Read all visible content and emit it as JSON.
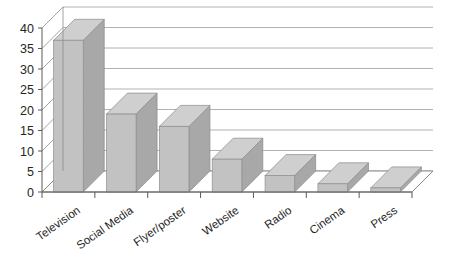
{
  "chart_data": {
    "type": "bar",
    "title": "",
    "subtitle": "",
    "xlabel": "",
    "ylabel": "",
    "categories": [
      "Television",
      "Social Media",
      "Flyer/poster",
      "Website",
      "Radio",
      "Cinema",
      "Press"
    ],
    "values": [
      37,
      19,
      16,
      8,
      4,
      2,
      1
    ],
    "series": [
      {
        "name": "",
        "values": [
          37,
          19,
          16,
          8,
          4,
          2,
          1
        ]
      }
    ],
    "ylim": [
      0,
      40
    ],
    "ytick_labels": [
      "0",
      "5",
      "10",
      "15",
      "20",
      "25",
      "30",
      "35",
      "40"
    ],
    "ytick_values": [
      0,
      5,
      10,
      15,
      20,
      25,
      30,
      35,
      40
    ],
    "grid": true,
    "grid_axis": "y",
    "legend": false,
    "legend_position": "none",
    "style": "3d",
    "x_label_rotation": "-35",
    "colors": {
      "bar_front": "#c2c2c2",
      "bar_side": "#a8a8a8",
      "bar_top": "#cfcfcf",
      "grid": "#9e9e9e",
      "axis": "#5a5a5a",
      "background": "#ffffff",
      "text": "#1f1f1f"
    }
  }
}
